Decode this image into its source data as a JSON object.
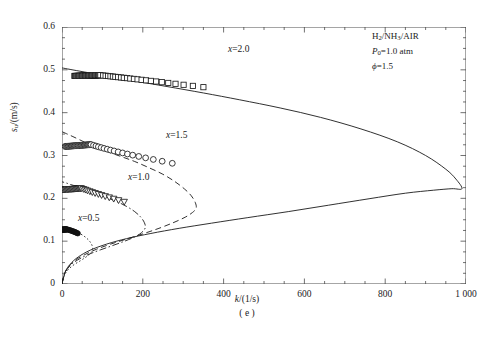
{
  "figure": {
    "subcaption": "( e )",
    "xlabel_html": "k/(1/s)",
    "ylabel_html": "s_u/(m/s)"
  },
  "annotations": {
    "line1": "H2/NH3/AIR",
    "line2": "P0=1.0 atm",
    "line3": "φ=1.5"
  },
  "series_labels": {
    "x20": "x=2.0",
    "x15": "x=1.5",
    "x10": "x=1.0",
    "x05": "x=0.5"
  },
  "axes": {
    "x_ticks": [
      "0",
      "200",
      "400",
      "600",
      "800",
      "1 000"
    ],
    "y_ticks": [
      "0",
      "0.1",
      "0.2",
      "0.3",
      "0.4",
      "0.5",
      "0.6"
    ],
    "xlim": [
      0,
      1000
    ],
    "ylim": [
      0,
      0.6
    ],
    "x_minor_step": 50,
    "y_minor_step": 0.025
  },
  "chart_data": {
    "type": "line",
    "title": "",
    "xlabel": "k/(1/s)",
    "ylabel": "s_u/(m/s)",
    "xlim": [
      0,
      1000
    ],
    "ylim": [
      0,
      0.6
    ],
    "grid": false,
    "legend": "inline-labels",
    "annotations": [
      "H2/NH3/AIR",
      "P0=1.0 atm",
      "φ=1.5"
    ],
    "series": [
      {
        "name": "x=2.0",
        "linestyle": "solid",
        "marker": "open-square",
        "color": "#1a1a1a",
        "turning_point": {
          "k": 990,
          "su": 0.222
        },
        "curve": [
          [
            0,
            0.0
          ],
          [
            8,
            0.028
          ],
          [
            20,
            0.046
          ],
          [
            40,
            0.063
          ],
          [
            70,
            0.079
          ],
          [
            110,
            0.093
          ],
          [
            160,
            0.106
          ],
          [
            220,
            0.118
          ],
          [
            290,
            0.13
          ],
          [
            370,
            0.142
          ],
          [
            460,
            0.155
          ],
          [
            560,
            0.169
          ],
          [
            660,
            0.184
          ],
          [
            760,
            0.199
          ],
          [
            850,
            0.212
          ],
          [
            920,
            0.219
          ],
          [
            965,
            0.2225
          ],
          [
            990,
            0.2225
          ],
          [
            975,
            0.245
          ],
          [
            950,
            0.268
          ],
          [
            900,
            0.3
          ],
          [
            830,
            0.332
          ],
          [
            740,
            0.362
          ],
          [
            640,
            0.389
          ],
          [
            540,
            0.411
          ],
          [
            440,
            0.43
          ],
          [
            350,
            0.446
          ],
          [
            260,
            0.461
          ],
          [
            180,
            0.474
          ],
          [
            110,
            0.486
          ],
          [
            55,
            0.495
          ],
          [
            20,
            0.501
          ],
          [
            0,
            0.5045
          ]
        ],
        "markers": [
          [
            95,
            0.4875
          ],
          [
            102,
            0.4868
          ],
          [
            108,
            0.4862
          ],
          [
            114,
            0.4856
          ],
          [
            120,
            0.4849
          ],
          [
            126,
            0.4843
          ],
          [
            132,
            0.4836
          ],
          [
            139,
            0.4829
          ],
          [
            146,
            0.4822
          ],
          [
            153,
            0.4814
          ],
          [
            161,
            0.4806
          ],
          [
            169,
            0.4797
          ],
          [
            178,
            0.4788
          ],
          [
            187,
            0.4778
          ],
          [
            197,
            0.4767
          ],
          [
            208,
            0.4755
          ],
          [
            220,
            0.4742
          ],
          [
            233,
            0.4728
          ],
          [
            247,
            0.4712
          ],
          [
            263,
            0.4694
          ],
          [
            281,
            0.4674
          ],
          [
            301,
            0.4651
          ],
          [
            324,
            0.4625
          ],
          [
            350,
            0.4595
          ]
        ]
      },
      {
        "name": "x=1.5",
        "linestyle": "dashed",
        "marker": "open-circle",
        "color": "#1a1a1a",
        "turning_point": {
          "k": 332,
          "su": 0.175
        },
        "curve": [
          [
            0,
            0.0
          ],
          [
            6,
            0.024
          ],
          [
            16,
            0.04
          ],
          [
            32,
            0.055
          ],
          [
            55,
            0.068
          ],
          [
            85,
            0.081
          ],
          [
            120,
            0.093
          ],
          [
            160,
            0.105
          ],
          [
            200,
            0.117
          ],
          [
            240,
            0.13
          ],
          [
            275,
            0.143
          ],
          [
            305,
            0.156
          ],
          [
            323,
            0.167
          ],
          [
            332,
            0.177
          ],
          [
            330,
            0.19
          ],
          [
            320,
            0.206
          ],
          [
            303,
            0.222
          ],
          [
            278,
            0.24
          ],
          [
            248,
            0.257
          ],
          [
            214,
            0.272
          ],
          [
            180,
            0.286
          ],
          [
            148,
            0.297
          ],
          [
            118,
            0.307
          ],
          [
            90,
            0.317
          ],
          [
            65,
            0.327
          ],
          [
            43,
            0.337
          ],
          [
            25,
            0.345
          ],
          [
            11,
            0.351
          ],
          [
            0,
            0.3555
          ]
        ],
        "markers": [
          [
            72,
            0.3255
          ],
          [
            78,
            0.3238
          ],
          [
            84,
            0.3221
          ],
          [
            90,
            0.3203
          ],
          [
            97,
            0.3185
          ],
          [
            104,
            0.3166
          ],
          [
            112,
            0.3147
          ],
          [
            120,
            0.3127
          ],
          [
            129,
            0.3106
          ],
          [
            139,
            0.3084
          ],
          [
            150,
            0.306
          ],
          [
            162,
            0.3035
          ],
          [
            175,
            0.3008
          ],
          [
            190,
            0.2978
          ],
          [
            207,
            0.2945
          ],
          [
            226,
            0.2908
          ],
          [
            248,
            0.2866
          ],
          [
            273,
            0.2818
          ]
        ]
      },
      {
        "name": "x=1.0",
        "linestyle": "dashdot",
        "marker": "open-triangle-down",
        "color": "#1a1a1a",
        "turning_point": {
          "k": 206,
          "su": 0.13
        },
        "curve": [
          [
            0,
            0.0
          ],
          [
            5,
            0.021
          ],
          [
            13,
            0.035
          ],
          [
            26,
            0.048
          ],
          [
            44,
            0.059
          ],
          [
            68,
            0.07
          ],
          [
            96,
            0.08
          ],
          [
            126,
            0.09
          ],
          [
            155,
            0.1
          ],
          [
            180,
            0.11
          ],
          [
            197,
            0.12
          ],
          [
            206,
            0.131
          ],
          [
            204,
            0.143
          ],
          [
            195,
            0.156
          ],
          [
            180,
            0.169
          ],
          [
            160,
            0.181
          ],
          [
            137,
            0.192
          ],
          [
            113,
            0.201
          ],
          [
            90,
            0.209
          ],
          [
            70,
            0.216
          ],
          [
            52,
            0.222
          ],
          [
            36,
            0.228
          ],
          [
            22,
            0.232
          ],
          [
            10,
            0.236
          ],
          [
            0,
            0.2385
          ]
        ],
        "markers": [
          [
            48,
            0.2232
          ],
          [
            53,
            0.2215
          ],
          [
            58,
            0.2198
          ],
          [
            63,
            0.218
          ],
          [
            69,
            0.2161
          ],
          [
            75,
            0.2141
          ],
          [
            82,
            0.212
          ],
          [
            90,
            0.2097
          ],
          [
            98,
            0.2073
          ],
          [
            107,
            0.2047
          ],
          [
            117,
            0.2019
          ],
          [
            128,
            0.1988
          ],
          [
            140,
            0.1954
          ],
          [
            154,
            0.1916
          ]
        ]
      },
      {
        "name": "x=0.5",
        "linestyle": "dotted",
        "marker": "filled-dense",
        "color": "#1a1a1a",
        "turning_point": {
          "k": 76,
          "su": 0.075
        },
        "curve": [
          [
            0,
            0.0
          ],
          [
            4,
            0.016
          ],
          [
            10,
            0.027
          ],
          [
            19,
            0.037
          ],
          [
            31,
            0.046
          ],
          [
            45,
            0.054
          ],
          [
            58,
            0.062
          ],
          [
            68,
            0.069
          ],
          [
            74,
            0.076
          ],
          [
            76,
            0.083
          ],
          [
            74,
            0.091
          ],
          [
            69,
            0.099
          ],
          [
            61,
            0.107
          ],
          [
            51,
            0.114
          ],
          [
            40,
            0.12
          ],
          [
            29,
            0.125
          ],
          [
            19,
            0.129
          ],
          [
            10,
            0.132
          ],
          [
            0,
            0.1345
          ]
        ],
        "markers": [
          [
            12,
            0.1275
          ],
          [
            15,
            0.1268
          ],
          [
            18,
            0.126
          ],
          [
            21,
            0.1251
          ],
          [
            24,
            0.1242
          ],
          [
            27,
            0.1232
          ],
          [
            30,
            0.1221
          ],
          [
            33,
            0.1209
          ],
          [
            36,
            0.1196
          ],
          [
            39,
            0.1182
          ]
        ]
      }
    ]
  }
}
